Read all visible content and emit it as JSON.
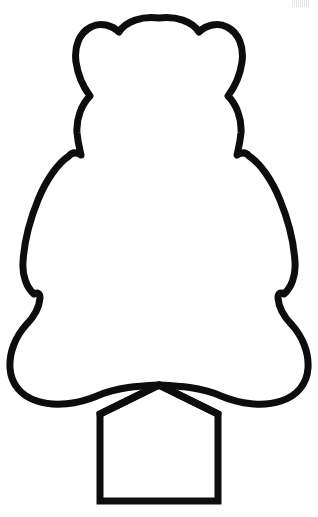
{
  "page": {
    "width": 318,
    "height": 517,
    "background_color": "#ffffff"
  },
  "artwork": {
    "name": "bear-outline",
    "description": "Line-art coloring page silhouette: rounded bear head with two ears, wide rounded body, lower paws, and a gabled rectangular trunk base",
    "stroke_color": "#0d0d0d",
    "fill_color": "#ffffff",
    "stroke_width": 7,
    "parts": [
      {
        "name": "head-and-body",
        "label": "Bear head and body outline",
        "stroke_width": 7
      },
      {
        "name": "trunk-base",
        "label": "Gabled rectangular base",
        "stroke_width": 7
      }
    ]
  },
  "watermark": {
    "name": "faint-top-right-mark",
    "label": "Faint scan artifact mark",
    "visible": true
  },
  "geometry": {
    "head_top_y": 17,
    "left_ear_center_x": 104,
    "right_ear_center_x": 215,
    "neck_notch_left": [
      80,
      155
    ],
    "neck_notch_right": [
      239,
      155
    ],
    "body_widest_left_x": 23,
    "body_widest_right_x": 296,
    "paw_notch_left": [
      38,
      296
    ],
    "paw_notch_right": [
      281,
      296
    ],
    "trunk_left_x": 100,
    "trunk_right_x": 218,
    "trunk_bottom_y": 501,
    "trunk_peak": [
      159,
      385
    ],
    "trunk_shoulder_y": 412
  }
}
